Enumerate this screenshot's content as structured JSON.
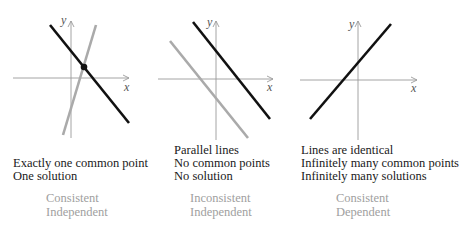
{
  "panels": [
    {
      "id": "one-solution",
      "axis_labels": {
        "x": "x",
        "y": "y"
      },
      "lines": [
        {
          "name": "black-line",
          "color": "#111111",
          "x1": 50,
          "y1": 25,
          "x2": 129,
          "y2": 123
        },
        {
          "name": "gray-line",
          "color": "#aaaaaa",
          "x1": 96,
          "y1": 25,
          "x2": 63,
          "y2": 135
        }
      ],
      "intersection_point": {
        "x": 84,
        "y": 67
      },
      "description": [
        "Exactly one common point",
        "One solution"
      ],
      "classification": [
        "Consistent",
        "Independent"
      ]
    },
    {
      "id": "no-solution",
      "axis_labels": {
        "x": "x",
        "y": "y"
      },
      "lines": [
        {
          "name": "black-line",
          "color": "#111111",
          "x1": 193,
          "y1": 22,
          "x2": 270,
          "y2": 119
        },
        {
          "name": "gray-line",
          "color": "#aaaaaa",
          "x1": 170,
          "y1": 41,
          "x2": 248,
          "y2": 138
        }
      ],
      "description": [
        "Parallel lines",
        "No common points",
        "No solution"
      ],
      "classification": [
        "Inconsistent",
        "Independent"
      ]
    },
    {
      "id": "infinite-solutions",
      "axis_labels": {
        "x": "x",
        "y": "y"
      },
      "lines": [
        {
          "name": "black-line",
          "color": "#111111",
          "x1": 310,
          "y1": 119,
          "x2": 391,
          "y2": 24
        }
      ],
      "description": [
        "Lines are identical",
        "Infinitely many common points",
        "Infinitely many solutions"
      ],
      "classification": [
        "Consistent",
        "Dependent"
      ]
    }
  ],
  "colors": {
    "primary_line": "#111111",
    "secondary_line": "#aaaaaa",
    "axis": "#9a9a9a",
    "classification_text": "#a0a0a0"
  }
}
